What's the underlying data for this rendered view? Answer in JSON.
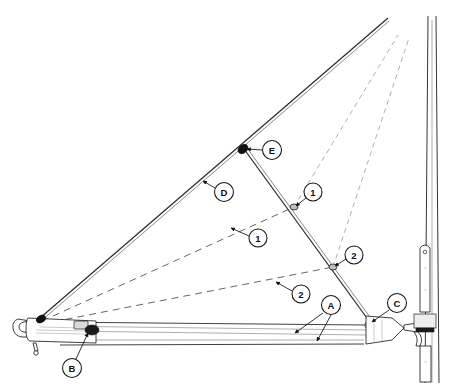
{
  "figure": {
    "background_color": "#ffffff",
    "line_color": "#1f1f1f",
    "dash_color": "#4a4a4a",
    "width": 449,
    "height": 390
  },
  "callouts": [
    {
      "id": "callout-A",
      "label": "A",
      "cx": 331,
      "cy": 305,
      "r": 9.5,
      "leaders": [
        {
          "x1": 323,
          "y1": 313,
          "x2": 295,
          "y2": 333
        },
        {
          "x1": 331,
          "y1": 315,
          "x2": 317,
          "y2": 341
        }
      ],
      "arrow_targets": [
        {
          "x": 295,
          "y": 333
        },
        {
          "x": 317,
          "y": 341
        }
      ]
    },
    {
      "id": "callout-B",
      "label": "B",
      "cx": 72,
      "cy": 368,
      "r": 9.5,
      "leaders": [
        {
          "x1": 76,
          "y1": 359,
          "x2": 88,
          "y2": 333
        }
      ],
      "arrow_targets": [
        {
          "x": 88,
          "y": 333
        }
      ]
    },
    {
      "id": "callout-C",
      "label": "C",
      "cx": 397,
      "cy": 303,
      "r": 9.5,
      "leaders": [
        {
          "x1": 389,
          "y1": 310,
          "x2": 372,
          "y2": 324
        }
      ],
      "arrow_targets": [
        {
          "x": 372,
          "y": 324
        }
      ]
    },
    {
      "id": "callout-D",
      "label": "D",
      "cx": 224,
      "cy": 192,
      "r": 9.5,
      "leaders": [
        {
          "x1": 215,
          "y1": 188,
          "x2": 203,
          "y2": 181
        }
      ],
      "arrow_targets": [
        {
          "x": 203,
          "y": 181
        }
      ]
    },
    {
      "id": "callout-E",
      "label": "E",
      "cx": 272,
      "cy": 150,
      "r": 9.5,
      "leaders": [
        {
          "x1": 262,
          "y1": 150,
          "x2": 244,
          "y2": 149
        }
      ],
      "arrow_targets": [
        {
          "x": 244,
          "y": 149
        }
      ]
    },
    {
      "id": "callout-1-upper",
      "label": "1",
      "cx": 313,
      "cy": 192,
      "r": 9.0,
      "leaders": [
        {
          "x1": 306,
          "y1": 198,
          "x2": 294,
          "y2": 207
        }
      ],
      "arrow_targets": [
        {
          "x": 294,
          "y": 207
        }
      ]
    },
    {
      "id": "callout-1-lower",
      "label": "1",
      "cx": 258,
      "cy": 238,
      "r": 9.0,
      "leaders": [
        {
          "x1": 249,
          "y1": 236,
          "x2": 231,
          "y2": 228
        }
      ],
      "arrow_targets": [
        {
          "x": 231,
          "y": 228
        }
      ]
    },
    {
      "id": "callout-2-upper",
      "label": "2",
      "cx": 354,
      "cy": 255,
      "r": 9.0,
      "leaders": [
        {
          "x1": 346,
          "y1": 259,
          "x2": 333,
          "y2": 267
        }
      ],
      "arrow_targets": [
        {
          "x": 333,
          "y": 267
        }
      ]
    },
    {
      "id": "callout-2-lower",
      "label": "2",
      "cx": 301,
      "cy": 294,
      "r": 9.0,
      "leaders": [
        {
          "x1": 292,
          "y1": 291,
          "x2": 276,
          "y2": 282
        }
      ],
      "arrow_targets": [
        {
          "x": 276,
          "y": 282
        }
      ]
    }
  ],
  "geometry": {
    "pole_tip_left": {
      "x": 40,
      "y": 318
    },
    "pole_end_right": {
      "x": 372,
      "y": 325
    },
    "mast_top": {
      "x": 431,
      "y": 16
    },
    "mast_base": {
      "x": 431,
      "y": 383
    },
    "apex_upper": {
      "x": 388,
      "y": 18
    },
    "node_E": {
      "x": 244,
      "y": 149
    },
    "node_1": {
      "x": 294,
      "y": 207
    },
    "node_2": {
      "x": 333,
      "y": 267
    },
    "boom_top_y": 322,
    "boom_bottom_y": 347
  },
  "lines": {
    "topping_lift": {
      "kind": "solid",
      "from": "pole_tip_left",
      "to": "apex_upper"
    },
    "bridle_upper": {
      "kind": "solid",
      "from": "node_E",
      "to": "pole_end_right"
    },
    "dash_lift_1": {
      "kind": "dashed",
      "from": "pole_tip_left",
      "to": "node_1"
    },
    "dash_lift_2": {
      "kind": "dashed",
      "from": "pole_tip_left",
      "to": "node_2"
    },
    "dash_to_mast_1": {
      "kind": "dashed-faint",
      "from": "node_1",
      "to": "mast_upper"
    },
    "dash_to_mast_2": {
      "kind": "dashed-faint",
      "from": "node_2",
      "to": "mast_upper"
    }
  },
  "legend": {
    "item_labels": [
      "A",
      "B",
      "C",
      "D",
      "E",
      "1",
      "2"
    ]
  }
}
